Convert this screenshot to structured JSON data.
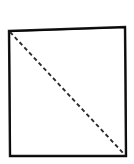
{
  "figure": {
    "background_color": "#ffffff",
    "canvas": {
      "width": 134,
      "height": 164
    },
    "shapes": {
      "square": {
        "name": "square-outline",
        "style": "hand-drawn solid outline",
        "stroke_color": "#1a1a1a",
        "stroke_width": 2.4,
        "corners": {
          "top_left": [
            9,
            31
          ],
          "top_right": [
            125,
            27
          ],
          "bottom_right": [
            126,
            156
          ],
          "bottom_left": [
            10,
            156
          ]
        },
        "path": "M 9 31 L 125 27 L 126 156 L 10 156 Z"
      },
      "diagonal": {
        "name": "dashed-diagonal",
        "style": "dashed line",
        "stroke_color": "#2b2b2b",
        "stroke_width": 1.8,
        "dash_pattern": "4 3",
        "start": [
          10,
          32
        ],
        "end": [
          125,
          155
        ],
        "path": "M 10 32 L 125 155"
      }
    }
  }
}
